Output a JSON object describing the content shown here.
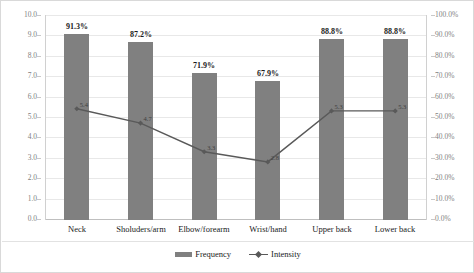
{
  "chart_data": {
    "type": "bar",
    "title": "",
    "subtitle": "",
    "xlabel": "",
    "ylabel": "",
    "grid": true,
    "legend_position": "bottom",
    "categories": [
      "Neck",
      "Sholuders/arm",
      "Elbow/forearm",
      "Wrist/hand",
      "Upper back",
      "Lower back"
    ],
    "series": [
      {
        "name": "Frequency",
        "type": "bar",
        "axis": "right",
        "unit": "%",
        "color": "#808080",
        "values": [
          91.3,
          87.2,
          71.9,
          67.9,
          88.8,
          88.8
        ],
        "labels": [
          "91.3%",
          "87.2%",
          "71.9%",
          "67.9%",
          "88.8%",
          "88.8%"
        ]
      },
      {
        "name": "Intensity",
        "type": "line",
        "axis": "left",
        "unit": "",
        "color": "#595959",
        "values": [
          5.4,
          4.7,
          3.3,
          2.8,
          5.3,
          5.3
        ],
        "labels": [
          "5.4",
          "4.7",
          "3.3",
          "2.8",
          "5.3",
          "5.3"
        ]
      }
    ],
    "axes": {
      "left": {
        "min": 0.0,
        "max": 10.0,
        "step": 1.0,
        "ticks": [
          "10.0",
          "9.0",
          "8.0",
          "7.0",
          "6.0",
          "5.0",
          "4.0",
          "3.0",
          "2.0",
          "1.0",
          "0.0"
        ]
      },
      "right": {
        "min": 0.0,
        "max": 100.0,
        "step": 10.0,
        "ticks": [
          "100.0%",
          "90.0%",
          "80.0%",
          "70.0%",
          "60.0%",
          "50.0%",
          "40.0%",
          "30.0%",
          "20.0%",
          "10.0%",
          "0.0%"
        ]
      }
    },
    "legend": [
      {
        "label": "Frequency",
        "marker": "bar-swatch",
        "color": "#808080"
      },
      {
        "label": "Intensity",
        "marker": "line-marker",
        "color": "#595959"
      }
    ]
  }
}
